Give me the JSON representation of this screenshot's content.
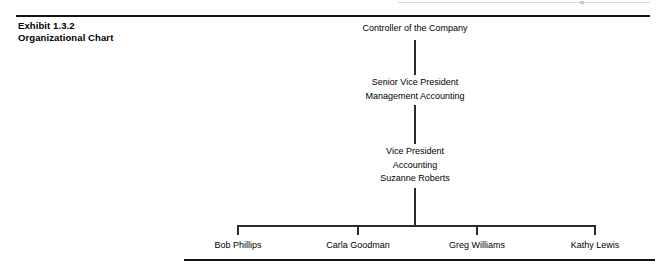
{
  "exhibit": {
    "number_label": "Exhibit 1.3.2",
    "title_label": "Organizational Chart"
  },
  "chart_data": {
    "type": "diagram",
    "title": "Organizational Chart",
    "subtitle": "Exhibit 1.3.2",
    "orientation": "top-down",
    "nodes": [
      {
        "id": "controller",
        "level": 0,
        "lines": [
          "Controller of the Company"
        ]
      },
      {
        "id": "svp",
        "level": 1,
        "lines": [
          "Senior Vice President",
          "Management Accounting"
        ]
      },
      {
        "id": "vp",
        "level": 2,
        "lines": [
          "Vice President",
          "Accounting",
          "Suzanne Roberts"
        ]
      },
      {
        "id": "leaf-1",
        "level": 3,
        "lines": [
          "Bob Phillips"
        ]
      },
      {
        "id": "leaf-2",
        "level": 3,
        "lines": [
          "Carla Goodman"
        ]
      },
      {
        "id": "leaf-3",
        "level": 3,
        "lines": [
          "Greg Williams"
        ]
      },
      {
        "id": "leaf-4",
        "level": 3,
        "lines": [
          "Kathy Lewis"
        ]
      }
    ],
    "edges": [
      {
        "from": "controller",
        "to": "svp"
      },
      {
        "from": "svp",
        "to": "vp"
      },
      {
        "from": "vp",
        "to": "leaf-1"
      },
      {
        "from": "vp",
        "to": "leaf-2"
      },
      {
        "from": "vp",
        "to": "leaf-3"
      },
      {
        "from": "vp",
        "to": "leaf-4"
      }
    ],
    "colors": {
      "text": "#000000",
      "line": "#2b2b2b",
      "rule": "#141414",
      "background": "#ffffff"
    }
  },
  "nodes": {
    "controller": {
      "line1": "Controller of the Company"
    },
    "svp": {
      "line1": "Senior Vice President",
      "line2": "Management Accounting"
    },
    "vp": {
      "line1": "Vice President",
      "line2": "Accounting",
      "line3": "Suzanne Roberts"
    },
    "leaves": [
      {
        "name": "Bob Phillips"
      },
      {
        "name": "Carla Goodman"
      },
      {
        "name": "Greg Williams"
      },
      {
        "name": "Kathy Lewis"
      }
    ]
  }
}
